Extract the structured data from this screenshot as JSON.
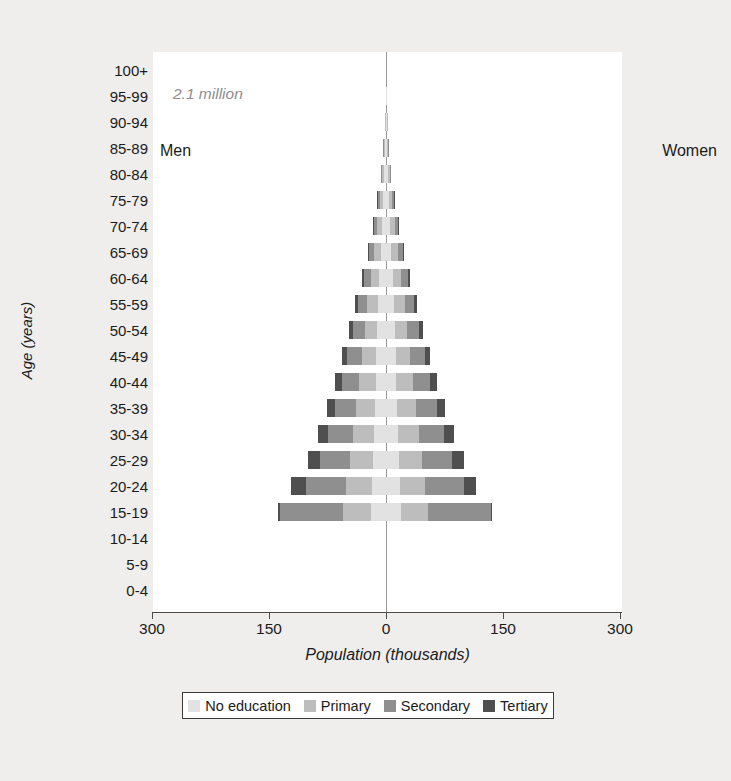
{
  "chart_data": {
    "type": "bar",
    "subtype": "population-pyramid",
    "title": "",
    "annotation": "2.1 million",
    "xlabel": "Population (thousands)",
    "ylabel": "Age (years)",
    "left_side_label": "Men",
    "right_side_label": "Women",
    "xlim": [
      -300,
      300
    ],
    "x_ticks": [
      300,
      150,
      0,
      150,
      300
    ],
    "x_tick_positions": [
      -300,
      -150,
      0,
      150,
      300
    ],
    "grid": false,
    "legend_position": "bottom",
    "categories": [
      "100+",
      "95-99",
      "90-94",
      "85-89",
      "80-84",
      "75-79",
      "70-74",
      "65-69",
      "60-64",
      "55-59",
      "50-54",
      "45-49",
      "40-44",
      "35-39",
      "30-34",
      "25-29",
      "20-24",
      "15-19",
      "10-14",
      "5-9",
      "0-4"
    ],
    "series": [
      {
        "name": "No education",
        "color": "#e2e2e2",
        "men": [
          0.3,
          0.5,
          0.9,
          1.6,
          2.6,
          3.9,
          5.4,
          7.0,
          8.6,
          10.0,
          11.2,
          12.4,
          13.4,
          14.4,
          15.6,
          16.8,
          18.0,
          19.4,
          0,
          0,
          0
        ],
        "women": [
          0.3,
          0.5,
          0.9,
          1.6,
          2.6,
          3.9,
          5.4,
          7.0,
          8.6,
          10.0,
          11.2,
          12.4,
          13.4,
          14.4,
          15.6,
          16.8,
          18.0,
          19.4,
          0,
          0,
          0
        ]
      },
      {
        "name": "Primary",
        "color": "#bdbdbd",
        "men": [
          0.2,
          0.4,
          0.8,
          1.5,
          2.6,
          4.2,
          6.2,
          8.6,
          11.2,
          13.8,
          16.2,
          18.6,
          21.0,
          23.6,
          26.4,
          29.4,
          33.0,
          36.0,
          0,
          0,
          0
        ],
        "women": [
          0.2,
          0.4,
          0.8,
          1.5,
          2.6,
          4.2,
          6.2,
          8.6,
          11.2,
          13.8,
          16.2,
          18.6,
          21.0,
          23.6,
          26.4,
          29.4,
          32.0,
          34.0,
          0,
          0,
          0
        ]
      },
      {
        "name": "Secondary",
        "color": "#8f8f8f",
        "men": [
          0.1,
          0.2,
          0.4,
          0.8,
          1.5,
          2.6,
          4.2,
          6.2,
          8.8,
          11.8,
          15.0,
          18.6,
          22.6,
          27.0,
          32.0,
          38.0,
          52.0,
          81.0,
          0,
          0,
          0
        ],
        "women": [
          0.1,
          0.2,
          0.4,
          0.8,
          1.5,
          2.6,
          4.2,
          6.2,
          8.8,
          11.8,
          15.0,
          18.6,
          22.6,
          27.0,
          32.0,
          38.0,
          50.0,
          81.0,
          0,
          0,
          0
        ]
      },
      {
        "name": "Tertiary",
        "color": "#4f4f4f",
        "men": [
          0.0,
          0.0,
          0.1,
          0.2,
          0.4,
          0.7,
          1.2,
          1.9,
          2.8,
          4.0,
          5.4,
          7.0,
          8.8,
          10.8,
          13.0,
          15.4,
          19.0,
          2.0,
          0,
          0,
          0
        ],
        "women": [
          0.0,
          0.0,
          0.1,
          0.2,
          0.4,
          0.7,
          1.2,
          1.9,
          2.8,
          4.0,
          5.4,
          7.0,
          8.8,
          10.8,
          13.0,
          15.4,
          16.0,
          1.5,
          0,
          0,
          0
        ]
      }
    ]
  },
  "legend": {
    "items": [
      {
        "label": "No education",
        "color": "#e2e2e2"
      },
      {
        "label": "Primary",
        "color": "#bdbdbd"
      },
      {
        "label": "Secondary",
        "color": "#8f8f8f"
      },
      {
        "label": "Tertiary",
        "color": "#4f4f4f"
      }
    ]
  }
}
